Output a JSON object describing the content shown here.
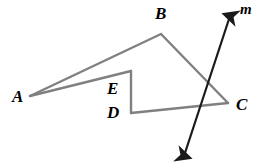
{
  "figure": {
    "type": "geometry-diagram",
    "background_color": "#ffffff",
    "shape_color": "#808080",
    "line_color": "#1a1a1a",
    "label_color": "#000000",
    "vertices": [
      {
        "name": "A",
        "x": 30,
        "y": 96
      },
      {
        "name": "B",
        "x": 161,
        "y": 34
      },
      {
        "name": "C",
        "x": 228,
        "y": 103
      },
      {
        "name": "E",
        "x": 131,
        "y": 71
      },
      {
        "name": "D",
        "x": 131,
        "y": 113
      }
    ],
    "segments": [
      {
        "name": "AB",
        "from": "A",
        "to": "B"
      },
      {
        "name": "BC",
        "from": "B",
        "to": "C"
      },
      {
        "name": "AE",
        "from": "A",
        "to": "E"
      },
      {
        "name": "ED",
        "from": "E",
        "to": "D"
      },
      {
        "name": "DC",
        "from": "D",
        "to": "C"
      }
    ],
    "transversal": {
      "name": "m",
      "label": "m",
      "arrow_start": {
        "x": 182,
        "y": 162
      },
      "arrow_end": {
        "x": 232,
        "y": 10
      },
      "double_headed": true
    },
    "labels": [
      {
        "id": "label-a",
        "text": "A",
        "x": 12,
        "y": 88
      },
      {
        "id": "label-b",
        "text": "B",
        "x": 155,
        "y": 5
      },
      {
        "id": "label-c",
        "text": "C",
        "x": 236,
        "y": 96
      },
      {
        "id": "label-e",
        "text": "E",
        "x": 107,
        "y": 80
      },
      {
        "id": "label-d",
        "text": "D",
        "x": 107,
        "y": 104
      },
      {
        "id": "label-m",
        "text": "m",
        "x": 240,
        "y": 2
      }
    ]
  }
}
